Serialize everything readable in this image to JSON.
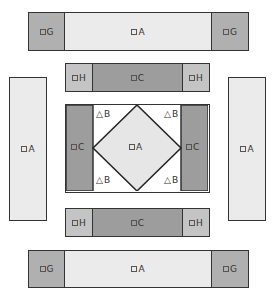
{
  "diagram": {
    "title": "",
    "pieces": {
      "top_strip": [
        {
          "label": "G",
          "shape": "square"
        },
        {
          "label": "A",
          "shape": "square"
        },
        {
          "label": "G",
          "shape": "square"
        }
      ],
      "top_h_strip": [
        {
          "label": "H",
          "shape": "square"
        },
        {
          "label": "C",
          "shape": "square"
        },
        {
          "label": "H",
          "shape": "square"
        }
      ],
      "left_side": {
        "label": "A",
        "shape": "square"
      },
      "right_side": {
        "label": "A",
        "shape": "square"
      },
      "center": {
        "left": {
          "label": "C",
          "shape": "square"
        },
        "right": {
          "label": "C",
          "shape": "square"
        },
        "diamond": {
          "label": "A",
          "shape": "square"
        },
        "corners": [
          {
            "label": "B",
            "shape": "triangle"
          },
          {
            "label": "B",
            "shape": "triangle"
          },
          {
            "label": "B",
            "shape": "triangle"
          },
          {
            "label": "B",
            "shape": "triangle"
          }
        ]
      },
      "bottom_h_strip": [
        {
          "label": "H",
          "shape": "square"
        },
        {
          "label": "C",
          "shape": "square"
        },
        {
          "label": "H",
          "shape": "square"
        }
      ],
      "bottom_strip": [
        {
          "label": "G",
          "shape": "square"
        },
        {
          "label": "A",
          "shape": "square"
        },
        {
          "label": "G",
          "shape": "square"
        }
      ]
    },
    "colors": {
      "A": "#ebebeb",
      "G": "#b0b0b0",
      "H": "#c4c4c4",
      "C": "#9d9d9d",
      "B": "#ffffff",
      "outline": "#333333"
    }
  }
}
